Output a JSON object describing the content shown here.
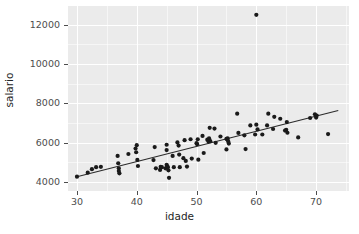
{
  "chart_data": {
    "type": "scatter",
    "title": "",
    "xlabel": "idade",
    "ylabel": "salario",
    "xlim": [
      28.5,
      75.5
    ],
    "ylim": [
      3550,
      12950
    ],
    "xticks": [
      30,
      40,
      50,
      60,
      70
    ],
    "yticks": [
      4000,
      6000,
      8000,
      10000,
      12000
    ],
    "xtick_labels": [
      "30",
      "40",
      "50",
      "60",
      "70"
    ],
    "ytick_labels": [
      "4000",
      "6000",
      "8000",
      "10000",
      "12000"
    ],
    "grid": true,
    "grid_color": "#ffffff",
    "panel_color": "#ebebeb",
    "point_color": "#1a1a1a",
    "line_color": "#2b2b2b",
    "legend": null,
    "annotations": [
      {
        "text": "outlier",
        "x": 60,
        "y": 12500
      }
    ],
    "fit_line": {
      "type": "linear",
      "x": [
        30.0,
        73.7
      ],
      "y": [
        4270,
        7640
      ],
      "slope": 77.1,
      "intercept": 1957
    },
    "x": [
      30.0,
      31.8,
      32.5,
      33.2,
      34.0,
      36.8,
      36.9,
      37.0,
      37.0,
      37.1,
      38.6,
      39.8,
      39.9,
      40.0,
      40.1,
      40.2,
      42.8,
      43.0,
      43.2,
      43.9,
      44.0,
      44.2,
      44.8,
      45.0,
      45.0,
      45.0,
      45.1,
      45.2,
      45.3,
      45.4,
      46.0,
      46.2,
      46.8,
      47.0,
      47.1,
      47.2,
      47.8,
      48.0,
      48.2,
      48.4,
      49.0,
      49.2,
      50.0,
      50.1,
      50.2,
      50.3,
      51.0,
      51.2,
      51.8,
      52.0,
      52.1,
      52.2,
      52.3,
      53.0,
      53.2,
      54.0,
      55.0,
      55.0,
      55.1,
      55.2,
      55.3,
      55.4,
      56.8,
      57.0,
      58.0,
      58.2,
      59.0,
      59.8,
      60.0,
      60.0,
      60.2,
      61.0,
      61.8,
      62.0,
      62.8,
      63.0,
      64.0,
      64.8,
      65.0,
      65.1,
      65.2,
      67.0,
      69.0,
      69.8,
      70.0,
      70.1,
      72.0
    ],
    "y": [
      4280,
      4480,
      4660,
      4760,
      4780,
      5330,
      4960,
      4700,
      4560,
      4450,
      5430,
      5710,
      5520,
      5880,
      5130,
      4820,
      5120,
      5780,
      4700,
      4620,
      4780,
      4760,
      4700,
      5900,
      5630,
      4880,
      4800,
      4760,
      4600,
      4220,
      5330,
      4760,
      6020,
      5860,
      5400,
      4760,
      5220,
      6130,
      5080,
      4790,
      6180,
      5200,
      5980,
      5930,
      6180,
      5140,
      6350,
      5480,
      6160,
      6060,
      6220,
      6760,
      6080,
      6720,
      6000,
      6320,
      6200,
      5660,
      6180,
      6220,
      6070,
      5960,
      7480,
      6500,
      6380,
      5680,
      6880,
      6420,
      12500,
      6920,
      6680,
      6420,
      6880,
      7480,
      6700,
      7320,
      7220,
      6620,
      6660,
      7050,
      6510,
      6270,
      7260,
      7450,
      7280,
      7380,
      6440
    ]
  }
}
